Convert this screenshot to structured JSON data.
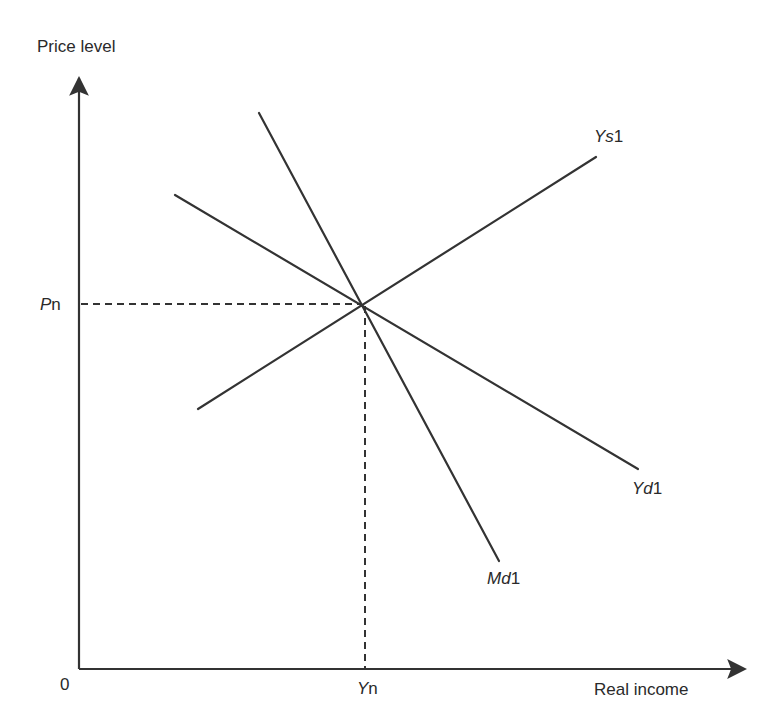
{
  "diagram": {
    "type": "AD-AS style economics diagram",
    "axes": {
      "y_label": "Price level",
      "x_label": "Real income",
      "origin_label": "0"
    },
    "equilibrium": {
      "price_label_italic": "P",
      "price_label_rest": "n",
      "income_label_italic": "Y",
      "income_label_rest": "n"
    },
    "curves": [
      {
        "id": "Ys1",
        "label_italic": "Ys",
        "label_rest": "1",
        "slope": "upward"
      },
      {
        "id": "Yd1",
        "label_italic": "Yd",
        "label_rest": "1",
        "slope": "downward"
      },
      {
        "id": "Md1",
        "label_italic": "Md",
        "label_rest": "1",
        "slope": "steep downward"
      }
    ],
    "colors": {
      "line": "#333333",
      "background": "#ffffff"
    }
  }
}
